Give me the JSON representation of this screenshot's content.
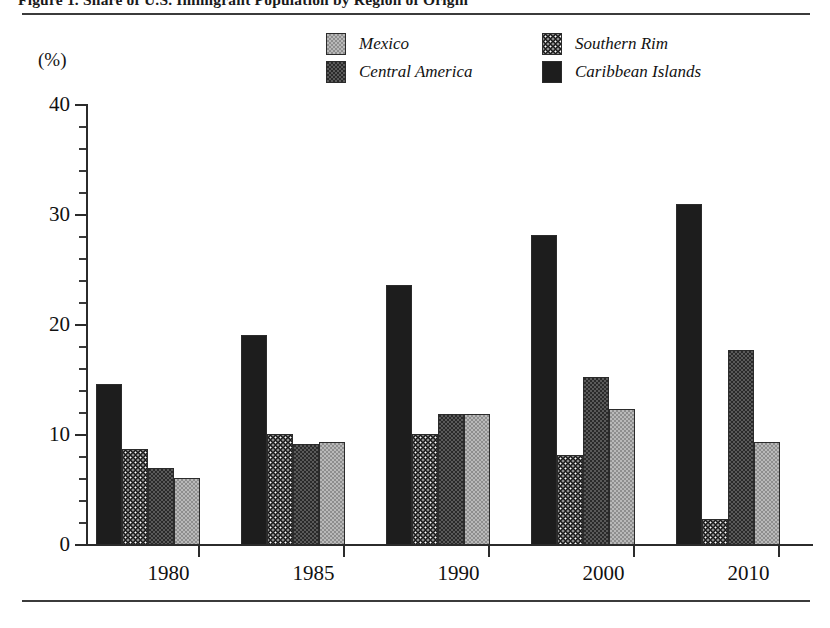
{
  "figure": {
    "title_clipped": "Figure 1.  Share of U.S. Immigrant Population by Region of Origin",
    "axis_unit_label": "(%)"
  },
  "legend": {
    "items": [
      {
        "label": "Mexico",
        "pattern": "light-gray-checker",
        "swatch_color": "#b9b9b9"
      },
      {
        "label": "Central America",
        "pattern": "dark-checker",
        "swatch_color": "#2a2a2a"
      },
      {
        "label": "Southern Rim",
        "pattern": "black-white-dots",
        "swatch_color": "#1b1b1b"
      },
      {
        "label": "Caribbean Islands",
        "pattern": "solid-black",
        "swatch_color": "#1d1d1d"
      }
    ]
  },
  "chart_data": {
    "type": "bar",
    "title": "Figure 1.  Share of U.S. Immigrant Population by Region of Origin",
    "xlabel": "",
    "ylabel": "(%)",
    "ylim": [
      0,
      40
    ],
    "yticks": [
      0,
      10,
      20,
      30,
      40
    ],
    "ytick_minor_step": 2,
    "grid": false,
    "legend_position": "top-center",
    "categories": [
      "1980",
      "1985",
      "1990",
      "2000",
      "2010"
    ],
    "bar_draw_order": [
      "Caribbean Islands",
      "Southern Rim",
      "Central America",
      "Mexico"
    ],
    "series": [
      {
        "name": "Caribbean Islands",
        "pattern": "solid-black",
        "values": [
          14.6,
          19.1,
          23.6,
          28.2,
          31.0
        ]
      },
      {
        "name": "Southern Rim",
        "pattern": "black-white-dots",
        "values": [
          8.7,
          10.1,
          10.1,
          8.2,
          2.4
        ]
      },
      {
        "name": "Central America",
        "pattern": "dark-checker",
        "values": [
          7.0,
          9.2,
          11.9,
          15.3,
          17.7
        ]
      },
      {
        "name": "Mexico",
        "pattern": "light-gray-checker",
        "values": [
          6.1,
          9.4,
          11.9,
          12.4,
          9.4
        ]
      }
    ]
  }
}
